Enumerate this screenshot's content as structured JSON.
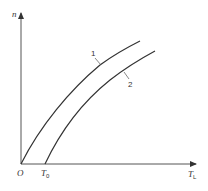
{
  "diagram": {
    "axes": {
      "y_label": "n",
      "x_label_main": "T",
      "x_label_sub": "L",
      "origin_label": "O",
      "x_marker_main": "T",
      "x_marker_sub": "0"
    },
    "curves": [
      {
        "label": "1",
        "start": "O"
      },
      {
        "label": "2",
        "start": "T0"
      }
    ],
    "colors": {
      "line": "#333333",
      "axis": "#555555",
      "background": "#ffffff"
    }
  }
}
